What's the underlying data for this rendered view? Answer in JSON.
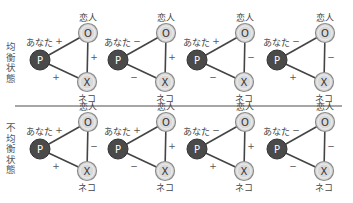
{
  "rows": [
    {
      "label": "均衡状態",
      "diagrams": [
        {
          "p_label": "あなた",
          "o_label": "恋人",
          "x_label": "ネコ",
          "p": "P",
          "o": "O",
          "x": "X",
          "po": "+",
          "ox": "+",
          "px": "+"
        },
        {
          "p_label": "あなた",
          "o_label": "恋人",
          "x_label": "ネコ",
          "p": "P",
          "o": "O",
          "x": "X",
          "po": "−",
          "ox": "+",
          "px": "−"
        },
        {
          "p_label": "あなた",
          "o_label": "恋人",
          "x_label": "ネコ",
          "p": "P",
          "o": "O",
          "x": "X",
          "po": "+",
          "ox": "−",
          "px": "−"
        },
        {
          "p_label": "あなた",
          "o_label": "恋人",
          "x_label": "ネコ",
          "p": "P",
          "o": "O",
          "x": "X",
          "po": "−",
          "ox": "−",
          "px": "+"
        }
      ]
    },
    {
      "label": "不均衡状態",
      "diagrams": [
        {
          "p_label": "あなた",
          "o_label": "恋人",
          "x_label": "ネコ",
          "p": "P",
          "o": "O",
          "x": "X",
          "po": "+",
          "ox": "−",
          "px": "+"
        },
        {
          "p_label": "あなた",
          "o_label": "恋人",
          "x_label": "ネコ",
          "p": "P",
          "o": "O",
          "x": "X",
          "po": "+",
          "ox": "+",
          "px": "−"
        },
        {
          "p_label": "あなた",
          "o_label": "恋人",
          "x_label": "ネコ",
          "p": "P",
          "o": "O",
          "x": "X",
          "po": "−",
          "ox": "+",
          "px": "+"
        },
        {
          "p_label": "あなた",
          "o_label": "恋人",
          "x_label": "ネコ",
          "p": "P",
          "o": "O",
          "x": "X",
          "po": "−",
          "ox": "−",
          "px": "−"
        }
      ]
    }
  ],
  "colors": {
    "p_fill": "#4a4a4a",
    "node_fill": "#d9d9d9",
    "node_stroke": "#8a8a8a",
    "edge": "#444444",
    "divider": "#888888"
  }
}
